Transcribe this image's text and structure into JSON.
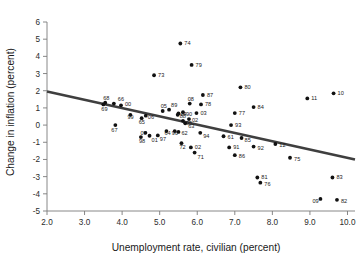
{
  "chart_data": {
    "type": "scatter",
    "title": "",
    "xlabel": "Unemployment rate, civilian (percent)",
    "ylabel": "Change in inflation (percent)",
    "xlim": [
      2.0,
      10.2
    ],
    "ylim": [
      -5.0,
      6.0
    ],
    "grid": false,
    "legend": "none",
    "xticks": [
      "2.0",
      "3.0",
      "4.0",
      "5.0",
      "6.0",
      "7.0",
      "8.0",
      "9.0",
      "10.0"
    ],
    "xtick_values": [
      2.0,
      3.0,
      4.0,
      5.0,
      6.0,
      7.0,
      8.0,
      9.0,
      10.0
    ],
    "yticks": [
      "6",
      "5",
      "4",
      "3",
      "2",
      "1",
      "0",
      "-1",
      "-2",
      "-3",
      "-4",
      "-5"
    ],
    "ytick_values": [
      6,
      5,
      4,
      3,
      2,
      1,
      0,
      -1,
      -2,
      -3,
      -4,
      -5
    ],
    "point_color": "#111111",
    "trend_color": "#3f3f3f",
    "axis_color": "#7a7a7a",
    "trendline": {
      "x": [
        2.0,
        10.2
      ],
      "y": [
        1.95,
        -2.0
      ],
      "label_position": "left"
    },
    "label_field": "year",
    "points": [
      {
        "label": "74",
        "x": 5.55,
        "y": 4.75,
        "lx": 4,
        "ly": 2
      },
      {
        "label": "79",
        "x": 5.85,
        "y": 3.5,
        "lx": 4,
        "ly": 2
      },
      {
        "label": "73",
        "x": 4.85,
        "y": 2.9,
        "lx": 4,
        "ly": 2
      },
      {
        "label": "80",
        "x": 7.15,
        "y": 2.2,
        "lx": 4,
        "ly": 2
      },
      {
        "label": "10",
        "x": 9.63,
        "y": 1.85,
        "lx": 4,
        "ly": 2
      },
      {
        "label": "87",
        "x": 6.15,
        "y": 1.75,
        "lx": 4,
        "ly": 2
      },
      {
        "label": "11",
        "x": 8.93,
        "y": 1.55,
        "lx": 4,
        "ly": 2
      },
      {
        "label": "68",
        "x": 3.55,
        "y": 1.3,
        "lx": -2,
        "ly": -3
      },
      {
        "label": "66",
        "x": 3.78,
        "y": 1.25,
        "lx": 4,
        "ly": -3
      },
      {
        "label": "00",
        "x": 3.97,
        "y": 1.15,
        "lx": 4,
        "ly": 1
      },
      {
        "label": "78",
        "x": 6.1,
        "y": 1.2,
        "lx": 4,
        "ly": 2
      },
      {
        "label": "08",
        "x": 5.8,
        "y": 1.25,
        "lx": -2,
        "ly": -3
      },
      {
        "label": "84",
        "x": 7.5,
        "y": 1.05,
        "lx": 4,
        "ly": 2
      },
      {
        "label": "69",
        "x": 3.5,
        "y": 1.2,
        "lx": -2,
        "ly": 7
      },
      {
        "label": "89",
        "x": 5.25,
        "y": 0.9,
        "lx": 2,
        "ly": -3
      },
      {
        "label": "05",
        "x": 5.08,
        "y": 0.82,
        "lx": -2,
        "ly": -3
      },
      {
        "label": "77",
        "x": 7.0,
        "y": 0.7,
        "lx": 4,
        "ly": 2
      },
      {
        "label": "03",
        "x": 5.98,
        "y": 0.7,
        "lx": 4,
        "ly": 2
      },
      {
        "label": "90",
        "x": 5.62,
        "y": 0.75,
        "lx": 3,
        "ly": 4
      },
      {
        "label": "04",
        "x": 5.5,
        "y": 0.68,
        "lx": 2,
        "ly": 3
      },
      {
        "label": "88",
        "x": 5.48,
        "y": 0.6,
        "lx": 2,
        "ly": 3
      },
      {
        "label": "06",
        "x": 4.63,
        "y": 0.55,
        "lx": 2,
        "ly": 3
      },
      {
        "label": "99",
        "x": 4.22,
        "y": 0.6,
        "lx": -3,
        "ly": 4
      },
      {
        "label": "02",
        "x": 5.78,
        "y": 0.35,
        "lx": 3,
        "ly": 3
      },
      {
        "label": "95",
        "x": 5.62,
        "y": 0.25,
        "lx": 3,
        "ly": 4
      },
      {
        "label": "93",
        "x": 6.9,
        "y": 0.0,
        "lx": 4,
        "ly": 2
      },
      {
        "label": "67",
        "x": 3.82,
        "y": 0.0,
        "lx": -4,
        "ly": 7
      },
      {
        "label": "65",
        "x": 4.52,
        "y": 0.4,
        "lx": -3,
        "ly": 6
      },
      {
        "label": "63",
        "x": 5.68,
        "y": 0.1,
        "lx": 3,
        "ly": 5
      },
      {
        "label": "62",
        "x": 5.5,
        "y": -0.4,
        "lx": 3,
        "ly": 3
      },
      {
        "label": "96",
        "x": 5.4,
        "y": -0.35,
        "lx": -3,
        "ly": 4
      },
      {
        "label": "64",
        "x": 5.18,
        "y": -0.35,
        "lx": -2,
        "ly": 4
      },
      {
        "label": "07",
        "x": 4.62,
        "y": -0.45,
        "lx": -5,
        "ly": 2
      },
      {
        "label": "01",
        "x": 4.73,
        "y": -0.62,
        "lx": 2,
        "ly": 6
      },
      {
        "label": "97",
        "x": 4.95,
        "y": -0.6,
        "lx": 2,
        "ly": 6
      },
      {
        "label": "98",
        "x": 4.5,
        "y": -0.7,
        "lx": -2,
        "ly": 6
      },
      {
        "label": "94",
        "x": 6.08,
        "y": -0.45,
        "lx": 3,
        "ly": 5
      },
      {
        "label": "61",
        "x": 6.7,
        "y": -0.65,
        "lx": 4,
        "ly": 3
      },
      {
        "label": "85",
        "x": 7.18,
        "y": -0.75,
        "lx": 3,
        "ly": 4
      },
      {
        "label": "12",
        "x": 8.08,
        "y": -1.1,
        "lx": 4,
        "ly": 3
      },
      {
        "label": "92",
        "x": 7.5,
        "y": -1.25,
        "lx": 4,
        "ly": 3
      },
      {
        "label": "91",
        "x": 6.85,
        "y": -1.3,
        "lx": 4,
        "ly": 2
      },
      {
        "label": "72",
        "x": 5.58,
        "y": -1.05,
        "lx": -2,
        "ly": 6
      },
      {
        "label": "02b",
        "x": 5.83,
        "y": -1.3,
        "lx": 4,
        "ly": 2
      },
      {
        "label": "86",
        "x": 7.0,
        "y": -1.75,
        "lx": 4,
        "ly": 3
      },
      {
        "label": "71",
        "x": 5.93,
        "y": -1.6,
        "lx": 3,
        "ly": 6
      },
      {
        "label": "75",
        "x": 8.47,
        "y": -1.9,
        "lx": 4,
        "ly": 3
      },
      {
        "label": "81",
        "x": 7.6,
        "y": -3.05,
        "lx": 4,
        "ly": 2
      },
      {
        "label": "83",
        "x": 9.6,
        "y": -3.05,
        "lx": 4,
        "ly": 2
      },
      {
        "label": "76",
        "x": 7.68,
        "y": -3.35,
        "lx": 4,
        "ly": 3
      },
      {
        "label": "09",
        "x": 9.28,
        "y": -4.3,
        "lx": -8,
        "ly": 4
      },
      {
        "label": "82",
        "x": 9.72,
        "y": -4.35,
        "lx": 4,
        "ly": 3
      }
    ]
  }
}
